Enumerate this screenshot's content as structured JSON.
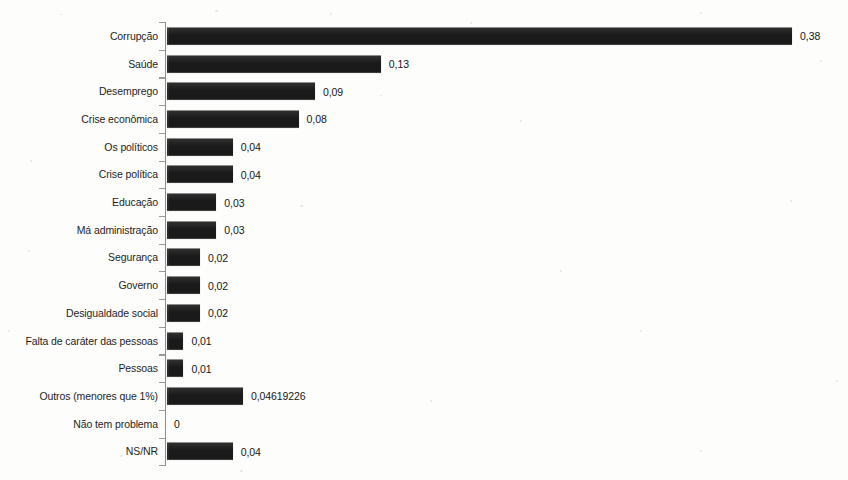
{
  "chart_data": {
    "type": "bar",
    "orientation": "horizontal",
    "title": "",
    "subtitle": "",
    "xlabel": "",
    "ylabel": "",
    "grid": false,
    "legend": null,
    "xlim": [
      0,
      0.42
    ],
    "axis_line_color": "#8d8d8d",
    "bar_color": "#1a1a1a",
    "value_decimal_separator": ",",
    "categories": [
      "Corrupção",
      "Saúde",
      "Desemprego",
      "Crise econômica",
      "Os políticos",
      "Crise política",
      "Educação",
      "Má administração",
      "Segurança",
      "Governo",
      "Desigualdade social",
      "Falta de caráter das pessoas",
      "Pessoas",
      "Outros (menores que 1%)",
      "Não tem problema",
      "NS/NR"
    ],
    "values": [
      0.38,
      0.13,
      0.09,
      0.08,
      0.04,
      0.04,
      0.03,
      0.03,
      0.02,
      0.02,
      0.02,
      0.01,
      0.01,
      0.04619226,
      0,
      0.04
    ],
    "value_labels": [
      "0,38",
      "0,13",
      "0,09",
      "0,08",
      "0,04",
      "0,04",
      "0,03",
      "0,03",
      "0,02",
      "0,02",
      "0,02",
      "0,01",
      "0,01",
      "0,04619226",
      "0",
      "0,04"
    ]
  }
}
